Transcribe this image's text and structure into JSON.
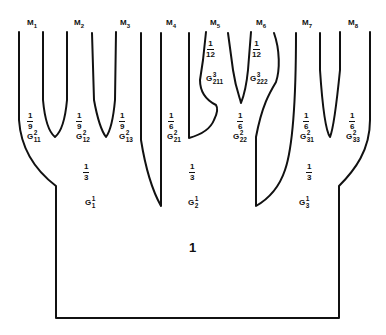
{
  "title": "",
  "leaves": [
    {
      "id": "M1",
      "label": "M",
      "sub": "1"
    },
    {
      "id": "M2",
      "label": "M",
      "sub": "2"
    },
    {
      "id": "M3",
      "label": "M",
      "sub": "3"
    },
    {
      "id": "M4",
      "label": "M",
      "sub": "4"
    },
    {
      "id": "M5",
      "label": "M",
      "sub": "5"
    },
    {
      "id": "M6",
      "label": "M",
      "sub": "6"
    },
    {
      "id": "M7",
      "label": "M",
      "sub": "7"
    },
    {
      "id": "M8",
      "label": "M",
      "sub": "8"
    }
  ],
  "level2": [
    {
      "num": "1",
      "den": "9",
      "g": "G",
      "sup": "2",
      "sub": "11"
    },
    {
      "num": "1",
      "den": "9",
      "g": "G",
      "sup": "2",
      "sub": "12"
    },
    {
      "num": "1",
      "den": "9",
      "g": "G",
      "sup": "2",
      "sub": "13"
    },
    {
      "num": "1",
      "den": "6",
      "g": "G",
      "sup": "2",
      "sub": "21"
    },
    {
      "num": "1",
      "den": "6",
      "g": "G",
      "sup": "2",
      "sub": "22"
    },
    {
      "num": "1",
      "den": "6",
      "g": "G",
      "sup": "2",
      "sub": "31"
    },
    {
      "num": "1",
      "den": "6",
      "g": "G",
      "sup": "2",
      "sub": "33"
    }
  ],
  "level3": [
    {
      "num": "1",
      "den": "12",
      "g": "G",
      "sup": "3",
      "sub": "211"
    },
    {
      "num": "1",
      "den": "12",
      "g": "G",
      "sup": "3",
      "sub": "222"
    }
  ],
  "level1": [
    {
      "num": "1",
      "den": "3",
      "g": "G",
      "sup": "1",
      "sub": "1"
    },
    {
      "num": "1",
      "den": "3",
      "g": "G",
      "sup": "1",
      "sub": "2"
    },
    {
      "num": "1",
      "den": "3",
      "g": "G",
      "sup": "1",
      "sub": "3"
    }
  ],
  "root": {
    "label": "1"
  },
  "colors": {
    "stroke": "#111111",
    "background": "#ffffff"
  }
}
